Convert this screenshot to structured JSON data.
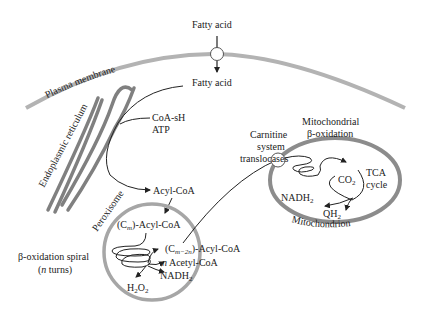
{
  "diagram": {
    "type": "cell fatty acid oxidation pathway",
    "labels": {
      "fatty_acid_top": "Fatty acid",
      "fatty_acid_inside": "Fatty acid",
      "plasma_membrane": "Plasma membrane",
      "endoplasmic_reticulum": "Endoplasmic reticulum",
      "coa_sh": "CoA-sH",
      "atp": "ATP",
      "acyl_coa": "Acyl-CoA",
      "peroxisome": "Peroxisome",
      "cm_acyl_coa_prefix": "(C",
      "cm_acyl_coa_sub": "m",
      "cm_acyl_coa_suffix": ")-Acyl-CoA",
      "cm2n_prefix": "(C",
      "cm2n_sub": "m−2n",
      "cm2n_suffix": ")-Acyl-CoA",
      "n_italic": "n",
      "acetyl_coa": " Acetyl-CoA",
      "nadh2_perox": "NADH",
      "nadh2_perox_sub": "2",
      "h2o2_h": "H",
      "h2o2_sub1": "2",
      "h2o2_o": "O",
      "h2o2_sub2": "2",
      "beta_spiral_line1": "β-oxidation spiral",
      "beta_spiral_line2_open": "(",
      "beta_spiral_line2_n": "n",
      "beta_spiral_line2_close": " turns)",
      "carnitine_1": "Carnitine",
      "carnitine_2": "system",
      "carnitine_3": "translocases",
      "mito_beta_1": "Mitochondrial",
      "mito_beta_2": "β-oxidation",
      "co2": "CO",
      "co2_sub": "2",
      "tca_1": "TCA",
      "tca_2": "cycle",
      "nadh2_mito": "NADH",
      "nadh2_mito_sub": "2",
      "qh2": "QH",
      "qh2_sub": "2",
      "mitochondrion": "Mitochondrion"
    },
    "colors": {
      "membrane": "#b3b3b3",
      "organelle_outline": "#8c8c8c",
      "er": "#808080",
      "line": "#222222"
    }
  }
}
